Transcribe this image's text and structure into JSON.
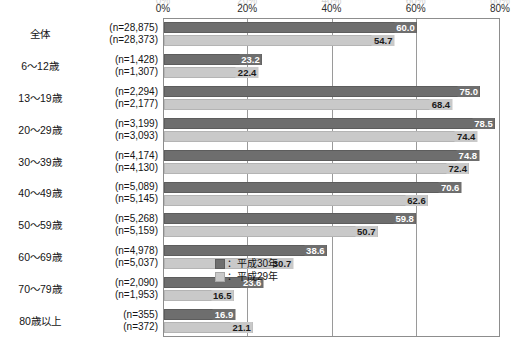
{
  "chart_data": {
    "type": "bar",
    "orientation": "horizontal",
    "title": "",
    "xlabel": "",
    "ylabel": "",
    "xlim": [
      0,
      80
    ],
    "grid": true,
    "grid_axis": "x",
    "legend_position": "inside-bottom-right",
    "tick_labels": [
      "0%",
      "20%",
      "40%",
      "60%",
      "80%"
    ],
    "ticks": [
      0,
      20,
      40,
      60,
      80
    ],
    "categories": [
      "全体",
      "6～12歳",
      "13～19歳",
      "20～29歳",
      "30～39歳",
      "40～49歳",
      "50～59歳",
      "60～69歳",
      "70～79歳",
      "80歳以上"
    ],
    "sample_sizes": [
      [
        "(n=28,875)",
        "(n=28,373)"
      ],
      [
        "(n=1,428)",
        "(n=1,307)"
      ],
      [
        "(n=2,294)",
        "(n=2,177)"
      ],
      [
        "(n=3,199)",
        "(n=3,093)"
      ],
      [
        "(n=4,174)",
        "(n=4,130)"
      ],
      [
        "(n=5,089)",
        "(n=5,145)"
      ],
      [
        "(n=5,268)",
        "(n=5,159)"
      ],
      [
        "(n=4,978)",
        "(n=5,037)"
      ],
      [
        "(n=2,090)",
        "(n=1,953)"
      ],
      [
        "(n=355)",
        "(n=372)"
      ]
    ],
    "series": [
      {
        "name": "：平成30年",
        "key": "y30",
        "color": "#6e6e6e",
        "values": [
          60.0,
          23.2,
          75.0,
          78.5,
          74.8,
          70.6,
          59.8,
          38.6,
          23.6,
          16.9
        ],
        "labels": [
          "60.0",
          "23.2",
          "75.0",
          "78.5",
          "74.8",
          "70.6",
          "59.8",
          "38.6",
          "23.6",
          "16.9"
        ]
      },
      {
        "name": "：平成29年",
        "key": "y29",
        "color": "#c9c9c9",
        "values": [
          54.7,
          22.4,
          68.4,
          74.4,
          72.4,
          62.6,
          50.7,
          30.7,
          16.5,
          21.1
        ],
        "labels": [
          "54.7",
          "22.4",
          "68.4",
          "74.4",
          "72.4",
          "62.6",
          "50.7",
          "30.7",
          "16.5",
          "21.1"
        ]
      }
    ]
  },
  "legend": {
    "items": [
      {
        "label": "：平成30年",
        "swatch": "y30"
      },
      {
        "label": "：平成29年",
        "swatch": "y29"
      }
    ]
  },
  "ghost_labels": [
    "0%",
    "20%",
    "40%",
    "60%",
    "80%"
  ]
}
